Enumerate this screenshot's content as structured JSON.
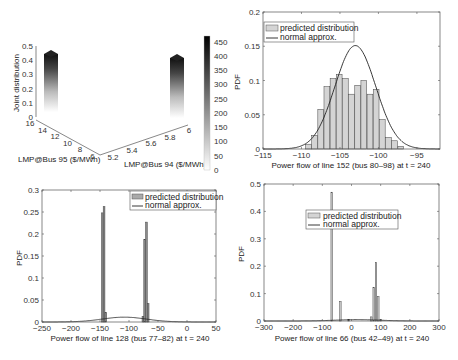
{
  "chart_data": [
    {
      "type": "bar3d",
      "title": "",
      "zlabel": "Joint distribution",
      "xlabel": "LMP@Bus 95 ($/MWh)",
      "ylabel": "LMP@Bus 94 ($/MWh)",
      "zticks": [
        "0",
        "0.1",
        "0.2",
        "0.3",
        "0.4",
        "0.5"
      ],
      "xticks": [
        "16",
        "14",
        "12",
        "10",
        "8",
        "6"
      ],
      "yticks": [
        "5.2",
        "5.4",
        "5.6",
        "5.8",
        "6"
      ],
      "zlim": [
        0,
        0.5
      ],
      "bars": [
        {
          "bus95": 15.5,
          "bus94": 5.2,
          "value": 0.45
        },
        {
          "bus95": 6.2,
          "bus94": 6.0,
          "value": 0.43
        }
      ],
      "colorbar": {
        "ticks": [
          "450",
          "400",
          "350",
          "300",
          "250",
          "200",
          "150",
          "100",
          "50",
          "0"
        ],
        "range": [
          0,
          470
        ]
      }
    },
    {
      "type": "bar",
      "xlabel": "Power flow of line 152 (bus 80–98) at t = 240",
      "ylabel": "PDF",
      "xlim": [
        -115,
        -92
      ],
      "ylim": [
        0,
        0.2
      ],
      "xticks": [
        "−115",
        "−110",
        "−105",
        "−100",
        "−95"
      ],
      "yticks": [
        "0",
        "0.05",
        "0.1",
        "0.15",
        "0.2"
      ],
      "legend": [
        "predicted distribution",
        "normal approx."
      ],
      "legend_position": "upper left",
      "series": [
        {
          "name": "predicted distribution",
          "x": [
            -109.1,
            -108.3,
            -107.5,
            -106.7,
            -105.9,
            -105.1,
            -104.3,
            -103.5,
            -102.7,
            -101.9,
            -101.1,
            -100.3,
            -99.5,
            -98.7,
            -97.9,
            -97.1
          ],
          "values": [
            0.007,
            0.02,
            0.058,
            0.091,
            0.103,
            0.109,
            0.103,
            0.08,
            0.093,
            0.1,
            0.08,
            0.087,
            0.043,
            0.017,
            0.012,
            0.004
          ]
        },
        {
          "name": "normal approx.",
          "mean": -103,
          "std": 2.65,
          "peak": 0.151
        }
      ]
    },
    {
      "type": "bar",
      "xlabel": "Power flow of line 128 (bus 77–82) at t = 240",
      "ylabel": "PDF",
      "xlim": [
        -250,
        50
      ],
      "ylim": [
        0,
        0.3
      ],
      "xticks": [
        "−250",
        "−200",
        "−150",
        "−100",
        "−50",
        "0",
        "50"
      ],
      "yticks": [
        "0",
        "0.05",
        "0.1",
        "0.15",
        "0.2",
        "0.25",
        "0.3"
      ],
      "legend": [
        "predicted distribution",
        "normal approx."
      ],
      "legend_position": "upper right",
      "series": [
        {
          "name": "predicted distribution",
          "x": [
            -146,
            -143,
            -140,
            -76,
            -73,
            -70,
            -67
          ],
          "values": [
            0.248,
            0.262,
            0.022,
            0.013,
            0.188,
            0.227,
            0.042
          ]
        },
        {
          "name": "normal approx.",
          "mean": -108,
          "std": 38,
          "peak": 0.011
        }
      ]
    },
    {
      "type": "bar",
      "xlabel": "Power flow of line 66 (bus 42–49) at t = 240",
      "ylabel": "PDF",
      "xlim": [
        -300,
        300
      ],
      "ylim": [
        0,
        0.5
      ],
      "xticks": [
        "−300",
        "−200",
        "−100",
        "0",
        "100",
        "200",
        "300"
      ],
      "yticks": [
        "0",
        "0.1",
        "0.2",
        "0.3",
        "0.4",
        "0.5"
      ],
      "legend": [
        "predicted distribution",
        "normal approx."
      ],
      "legend_position": "upper center",
      "series": [
        {
          "name": "predicted distribution",
          "x": [
            -68,
            -38,
            -10,
            68,
            76,
            84,
            92,
            100
          ],
          "values": [
            0.47,
            0.071,
            0.005,
            0.015,
            0.123,
            0.214,
            0.089,
            0.006
          ]
        },
        {
          "name": "normal approx.",
          "mean": 20,
          "std": 75,
          "peak": 0.005
        }
      ]
    }
  ],
  "labels": {
    "p1_z": "Joint distribution",
    "p1_x": "LMP@Bus 95 ($/MWh)",
    "p1_y": "LMP@Bus 94 ($/MWh)",
    "p2_x": "Power flow of line 152 (bus 80–98) at t = 240",
    "p3_x": "Power flow of line 128 (bus 77–82) at t = 240",
    "p4_x": "Power flow of line 66 (bus 42–49) at t = 240",
    "pdf": "PDF",
    "leg_pred": "predicted distribution",
    "leg_norm": "normal approx."
  }
}
